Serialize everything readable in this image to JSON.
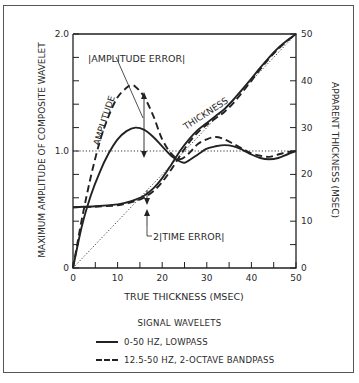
{
  "chart_data": {
    "type": "line",
    "title": "",
    "xlabel": "TRUE THICKNESS (MSEC)",
    "ylabel": "MAXIMUM AMPLITUDE OF COMPOSITE WAVELET",
    "ylabel_right": "APPARENT THICKNESS (MSEC)",
    "xlim": [
      0,
      50
    ],
    "ylim": [
      0,
      2.0
    ],
    "ylim_right": [
      0,
      50
    ],
    "x_ticks": [
      0,
      10,
      20,
      30,
      40,
      50
    ],
    "x_tick_labels": [
      "0",
      "10",
      "20",
      "30",
      "40",
      "50"
    ],
    "y_ticks": [
      0,
      1.0,
      2.0
    ],
    "y_tick_labels": [
      "0",
      "1.0",
      "2.0"
    ],
    "y_right_ticks": [
      0,
      10,
      20,
      30,
      40,
      50
    ],
    "y_right_tick_labels": [
      "0",
      "10",
      "20",
      "30",
      "40",
      "50"
    ],
    "grid": false,
    "reference_lines": [
      {
        "name": "unit amplitude",
        "axis": "left",
        "y": 1.0,
        "style": "dotted"
      },
      {
        "name": "true thickness (y = x)",
        "axis": "right",
        "points": [
          [
            0,
            0
          ],
          [
            50,
            50
          ]
        ],
        "style": "dotted"
      }
    ],
    "series": [
      {
        "name": "Amplitude, 0-50 Hz lowpass",
        "axis": "left",
        "style": "solid",
        "x": [
          0,
          2,
          4,
          6,
          8,
          10,
          12,
          14,
          16,
          18,
          20,
          22,
          24,
          25,
          26,
          28,
          30,
          32,
          34,
          36,
          38,
          40,
          42,
          44,
          46,
          48,
          50
        ],
        "values": [
          0,
          0.36,
          0.62,
          0.82,
          0.98,
          1.1,
          1.17,
          1.2,
          1.18,
          1.12,
          1.04,
          0.96,
          0.91,
          0.9,
          0.92,
          0.97,
          1.02,
          1.04,
          1.05,
          1.04,
          1.01,
          0.97,
          0.94,
          0.93,
          0.94,
          0.97,
          1.0
        ]
      },
      {
        "name": "Amplitude, 12.5-50 Hz 2-octave bandpass",
        "axis": "left",
        "style": "dashed",
        "x": [
          0,
          2,
          4,
          6,
          8,
          10,
          12,
          13,
          14,
          16,
          18,
          20,
          22,
          24,
          26,
          28,
          30,
          32,
          34,
          36,
          38,
          40,
          42,
          44,
          46,
          48,
          50
        ],
        "values": [
          0,
          0.42,
          0.78,
          1.08,
          1.3,
          1.46,
          1.54,
          1.56,
          1.55,
          1.46,
          1.3,
          1.1,
          0.98,
          0.93,
          0.98,
          1.06,
          1.1,
          1.12,
          1.1,
          1.06,
          1.02,
          0.98,
          0.96,
          0.95,
          0.97,
          0.99,
          1.0
        ]
      },
      {
        "name": "Apparent thickness, 0-50 Hz lowpass",
        "axis": "right",
        "style": "solid",
        "x": [
          0,
          5,
          10,
          12,
          14,
          16,
          18,
          20,
          22,
          24,
          26,
          28,
          30,
          32,
          34,
          36,
          38,
          40,
          42,
          44,
          46,
          48,
          50
        ],
        "values": [
          13,
          13.2,
          13.6,
          14,
          14.6,
          15.5,
          17,
          19.2,
          22,
          25,
          27.5,
          29.5,
          31,
          32.5,
          34,
          36,
          38.2,
          40.5,
          42.8,
          45,
          47,
          48.6,
          50
        ]
      },
      {
        "name": "Apparent thickness, 12.5-50 Hz 2-octave bandpass",
        "axis": "right",
        "style": "dashed",
        "x": [
          0,
          5,
          10,
          12,
          14,
          16,
          18,
          20,
          22,
          24,
          26,
          28,
          30,
          32,
          34,
          36,
          38,
          40,
          42,
          44,
          46,
          48,
          50
        ],
        "values": [
          13,
          13.1,
          13.4,
          13.8,
          14.3,
          15.1,
          16.4,
          18.4,
          21,
          24,
          26.8,
          29,
          30.6,
          32,
          33.4,
          35.3,
          37.6,
          40,
          42.5,
          44.8,
          46.8,
          48.5,
          50
        ]
      }
    ],
    "annotations": [
      {
        "text": "|AMPLITUDE ERROR|",
        "x": 9,
        "y_left": 1.8
      },
      {
        "text": "AMPLITUDE",
        "rotated": true,
        "x": 5,
        "y_left": 1.3
      },
      {
        "text": "THICKNESS",
        "rotated": true,
        "x": 26,
        "y_right": 30
      },
      {
        "text": "2|TIME ERROR|",
        "x": 17,
        "y_right": 11
      }
    ],
    "legend": {
      "title": "SIGNAL WAVELETS",
      "position": "bottom",
      "entries": [
        {
          "label": "0-50 HZ, LOWPASS",
          "style": "solid"
        },
        {
          "label": "12.5-50 HZ, 2-OCTAVE BANDPASS",
          "style": "dashed"
        }
      ]
    }
  },
  "labels": {
    "x_axis": "TRUE THICKNESS (MSEC)",
    "y_axis_left": "MAXIMUM AMPLITUDE OF COMPOSITE WAVELET",
    "y_axis_right": "APPARENT THICKNESS (MSEC)",
    "amplitude_error": "|AMPLITUDE ERROR|",
    "amplitude": "AMPLITUDE",
    "thickness": "THICKNESS",
    "time_error": "2|TIME ERROR|"
  },
  "legend": {
    "title": "SIGNAL WAVELETS",
    "items": [
      {
        "label": "0-50 HZ, LOWPASS"
      },
      {
        "label": "12.5-50 HZ, 2-OCTAVE BANDPASS"
      }
    ]
  },
  "colors": {
    "ink": "#222222",
    "frame": "#555555",
    "background": "#ffffff"
  }
}
